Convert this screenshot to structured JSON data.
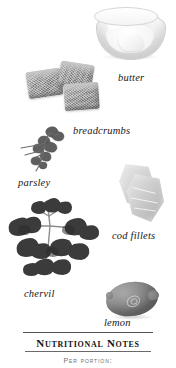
{
  "page": {
    "background_color": "#ffffff",
    "style": "grayscale cookbook ingredient plate"
  },
  "ingredients": [
    {
      "id": "butter",
      "label": "butter",
      "icon": "glass-bowl-of-butter-image"
    },
    {
      "id": "breadcrumbs",
      "label": "breadcrumbs",
      "icon": "bread-cubes-image"
    },
    {
      "id": "parsley",
      "label": "parsley",
      "icon": "parsley-sprig-image"
    },
    {
      "id": "cod-fillets",
      "label": "cod fillets",
      "icon": "cod-fillets-image"
    },
    {
      "id": "chervil",
      "label": "chervil",
      "icon": "chervil-sprig-image"
    },
    {
      "id": "lemon",
      "label": "lemon",
      "icon": "lemon-image"
    }
  ],
  "footer": {
    "heading": "Nutritional Notes",
    "subheading": "Per portion:"
  },
  "colors": {
    "ink": "#141414",
    "rule": "#555555",
    "muted": "#6d6d6d",
    "paper": "#ffffff"
  }
}
